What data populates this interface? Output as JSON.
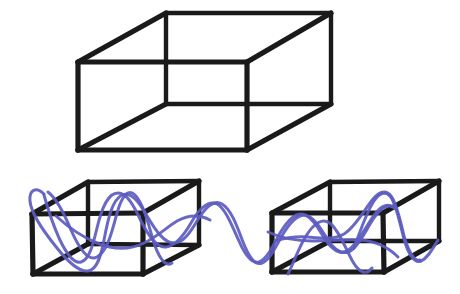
{
  "figure": {
    "background_color": "#ffffff",
    "width": 460,
    "height": 294
  },
  "style": {
    "edge_color": "#1a1a1a",
    "edge_width": 5.2,
    "edge_width_thin": 4.4,
    "wave_color": "#5c5cc0",
    "wave_color_light": "#7a7ad0",
    "wave_width": 3.0
  },
  "shapes": {
    "top_box": {
      "name": "large-wireframe-box",
      "label": "Top large transparent cuboid",
      "front_face": [
        [
          78,
          62
        ],
        [
          247,
          62
        ],
        [
          247,
          150
        ],
        [
          78,
          150
        ]
      ],
      "back_face": [
        [
          166,
          13
        ],
        [
          331,
          13
        ],
        [
          331,
          104
        ],
        [
          166,
          104
        ]
      ],
      "vertices": {
        "front_top_left": [
          78,
          62
        ],
        "front_top_right": [
          247,
          62
        ],
        "front_bottom_right": [
          247,
          150
        ],
        "front_bottom_left": [
          78,
          150
        ],
        "back_top_left": [
          166,
          13
        ],
        "back_top_right": [
          331,
          13
        ],
        "back_bottom_right": [
          331,
          104
        ],
        "back_bottom_left": [
          166,
          104
        ]
      },
      "edges": [
        [
          [
            78,
            62
          ],
          [
            247,
            62
          ]
        ],
        [
          [
            247,
            62
          ],
          [
            247,
            150
          ]
        ],
        [
          [
            247,
            150
          ],
          [
            78,
            150
          ]
        ],
        [
          [
            78,
            150
          ],
          [
            78,
            62
          ]
        ],
        [
          [
            166,
            13
          ],
          [
            331,
            13
          ]
        ],
        [
          [
            331,
            13
          ],
          [
            331,
            104
          ]
        ],
        [
          [
            331,
            104
          ],
          [
            166,
            104
          ]
        ],
        [
          [
            166,
            104
          ],
          [
            166,
            13
          ]
        ],
        [
          [
            78,
            62
          ],
          [
            166,
            13
          ]
        ],
        [
          [
            247,
            62
          ],
          [
            331,
            13
          ]
        ],
        [
          [
            247,
            150
          ],
          [
            331,
            104
          ]
        ],
        [
          [
            78,
            150
          ],
          [
            166,
            104
          ]
        ]
      ]
    },
    "left_box": {
      "name": "left-wireframe-box",
      "label": "Lower-left transparent cuboid",
      "vertices": {
        "front_top_left": [
          32,
          214
        ],
        "front_top_right": [
          143,
          213
        ],
        "front_bottom_right": [
          143,
          274
        ],
        "front_bottom_left": [
          33,
          274
        ],
        "back_top_left": [
          88,
          182
        ],
        "back_top_right": [
          199,
          181
        ],
        "back_bottom_right": [
          199,
          245
        ],
        "back_bottom_left": [
          88,
          244
        ]
      },
      "edges": [
        [
          [
            32,
            214
          ],
          [
            143,
            213
          ]
        ],
        [
          [
            143,
            213
          ],
          [
            143,
            274
          ]
        ],
        [
          [
            143,
            274
          ],
          [
            33,
            274
          ]
        ],
        [
          [
            33,
            274
          ],
          [
            32,
            214
          ]
        ],
        [
          [
            88,
            182
          ],
          [
            199,
            181
          ]
        ],
        [
          [
            199,
            181
          ],
          [
            199,
            245
          ]
        ],
        [
          [
            199,
            245
          ],
          [
            88,
            244
          ]
        ],
        [
          [
            88,
            244
          ],
          [
            88,
            182
          ]
        ],
        [
          [
            32,
            214
          ],
          [
            88,
            182
          ]
        ],
        [
          [
            143,
            213
          ],
          [
            199,
            181
          ]
        ],
        [
          [
            143,
            274
          ],
          [
            199,
            245
          ]
        ],
        [
          [
            33,
            274
          ],
          [
            88,
            244
          ]
        ]
      ]
    },
    "right_box": {
      "name": "right-wireframe-box",
      "label": "Lower-right transparent cuboid",
      "vertices": {
        "front_top_left": [
          272,
          213
        ],
        "front_top_right": [
          383,
          213
        ],
        "front_bottom_right": [
          384,
          272
        ],
        "front_bottom_left": [
          272,
          272
        ],
        "back_top_left": [
          330,
          182
        ],
        "back_top_right": [
          439,
          181
        ],
        "back_bottom_right": [
          439,
          241
        ],
        "back_bottom_left": [
          330,
          241
        ]
      },
      "edges": [
        [
          [
            272,
            213
          ],
          [
            383,
            213
          ]
        ],
        [
          [
            383,
            213
          ],
          [
            384,
            272
          ]
        ],
        [
          [
            384,
            272
          ],
          [
            272,
            272
          ]
        ],
        [
          [
            272,
            272
          ],
          [
            272,
            213
          ]
        ],
        [
          [
            330,
            182
          ],
          [
            439,
            181
          ]
        ],
        [
          [
            439,
            181
          ],
          [
            439,
            241
          ]
        ],
        [
          [
            439,
            241
          ],
          [
            330,
            241
          ]
        ],
        [
          [
            330,
            241
          ],
          [
            330,
            182
          ]
        ],
        [
          [
            272,
            213
          ],
          [
            330,
            182
          ]
        ],
        [
          [
            383,
            213
          ],
          [
            439,
            181
          ]
        ],
        [
          [
            384,
            272
          ],
          [
            439,
            241
          ]
        ],
        [
          [
            272,
            272
          ],
          [
            330,
            241
          ]
        ]
      ]
    }
  },
  "wave": {
    "name": "blue-signal-wave",
    "label": "Hand drawn blue wave threading through both lower boxes",
    "color": "#5c5cc0",
    "stroke_width": 3.0,
    "strands": [
      {
        "name": "wave-strand-main",
        "path": "M 44 194 C 36 186 29 190 30 201 C 31 214 44 232 57 248 C 68 262 80 272 88 271 C 97 270 101 256 104 240 C 108 219 112 200 122 195 C 131 191 139 202 147 216 C 156 231 164 243 174 243 C 183 243 190 233 197 221 C 205 208 213 199 222 204 C 231 209 237 226 243 242 C 249 257 255 266 262 263 C 270 260 276 246 283 234 C 291 221 299 212 308 216 C 317 220 323 233 330 243 C 337 252 345 256 353 249 C 361 242 367 228 374 218 C 381 208 388 203 395 208"
      },
      {
        "name": "wave-strand-secondary",
        "path": "M 44 195 C 47 206 52 222 59 238 C 66 253 74 264 81 262 C 89 260 93 245 97 228 C 102 207 108 193 118 193 C 127 193 134 206 141 221 C 149 237 157 248 166 247 C 176 246 184 235 191 223 C 199 209 208 200 217 204 C 226 209 232 226 239 241 C 245 255 252 264 259 262 C 267 259 273 246 280 233 C 288 220 296 211 305 215 C 314 219 320 232 327 242 C 334 251 342 256 350 249 C 358 242 365 229 372 218 C 379 208 386 202 393 207"
      },
      {
        "name": "wave-strand-left-loop",
        "path": "M 48 192 C 57 199 64 213 71 230 C 79 248 88 262 97 257 C 107 252 112 232 117 213 C 122 196 128 188 135 195 C 143 203 148 222 153 240 C 158 256 165 268 172 263"
      },
      {
        "name": "wave-strand-right-box",
        "path": "M 275 241 C 285 238 296 236 308 237 C 321 238 333 240 344 234 C 354 228 362 214 370 203 C 377 193 385 188 391 196 C 397 204 400 220 404 236 C 408 250 414 262 420 260"
      },
      {
        "name": "wave-strand-right-peak",
        "path": "M 288 274 C 294 262 299 247 306 236 C 314 223 323 217 331 224 C 340 232 346 250 353 262 C 359 272 366 276 372 268"
      },
      {
        "name": "wave-strand-right-tail",
        "path": "M 354 248 C 360 232 366 213 374 201 C 380 192 387 190 392 199 C 397 208 400 224 404 239 C 408 253 414 264 421 261 C 428 258 433 248 438 240"
      },
      {
        "name": "wave-strand-left-inner",
        "path": "M 56 216 C 68 227 82 237 97 243 C 114 250 130 250 144 243 C 157 237 167 227 177 221 C 188 215 199 214 210 220"
      },
      {
        "name": "wave-strand-right-inner",
        "path": "M 268 232 C 281 238 296 241 312 241 C 329 241 345 239 360 240 C 375 241 388 247 398 257"
      }
    ]
  }
}
